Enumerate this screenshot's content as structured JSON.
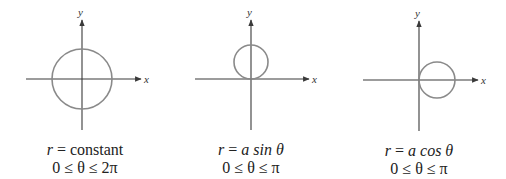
{
  "panels": [
    {
      "id": "constant",
      "axes": {
        "x_label": "x",
        "y_label": "y"
      },
      "equation_lhs": "r",
      "equation_rhs": "constant",
      "range": "0 ≤ θ ≤ 2π",
      "circle": {
        "cx": 82,
        "cy": 79,
        "r": 30
      },
      "origin": {
        "x": 82,
        "y": 79
      }
    },
    {
      "id": "a-sin-theta",
      "axes": {
        "x_label": "x",
        "y_label": "y"
      },
      "equation_lhs": "r",
      "equation_rhs": "a sin θ",
      "range": "0 ≤ θ ≤ π",
      "circle": {
        "cx": 251,
        "cy": 62,
        "r": 17
      },
      "origin": {
        "x": 251,
        "y": 79
      }
    },
    {
      "id": "a-cos-theta",
      "axes": {
        "x_label": "x",
        "y_label": "y"
      },
      "equation_lhs": "r",
      "equation_rhs": "a cos θ",
      "range": "0 ≤ θ ≤ π",
      "circle": {
        "cx": 437,
        "cy": 80,
        "r": 18
      },
      "origin": {
        "x": 419,
        "y": 80
      }
    }
  ],
  "colors": {
    "axis": "#3a3a3a",
    "curve": "#8a8a8a"
  }
}
